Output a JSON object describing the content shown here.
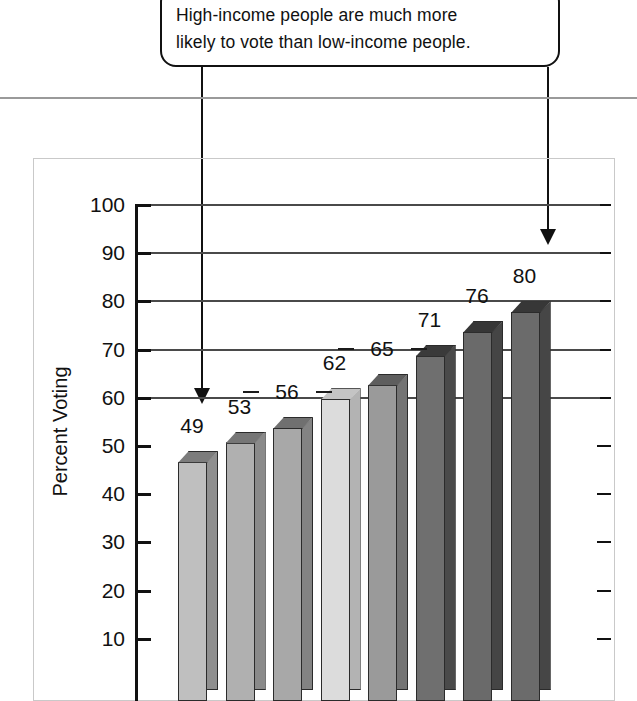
{
  "callout": {
    "text": "High-income people are much more\nlikely to vote than low-income people."
  },
  "chart_data": {
    "type": "bar",
    "title": "",
    "xlabel": "",
    "ylabel": "Percent Voting",
    "ylim": [
      0,
      100
    ],
    "ytick_labels": [
      "100",
      "90",
      "80",
      "70",
      "60",
      "50",
      "40",
      "30",
      "20",
      "10"
    ],
    "ytick_values": [
      100,
      90,
      80,
      70,
      60,
      50,
      40,
      30,
      20,
      10
    ],
    "gridlines_at": [
      100,
      90,
      80,
      70,
      60
    ],
    "grid": true,
    "legend": "none",
    "categories": [
      "1",
      "2",
      "3",
      "4",
      "5",
      "6",
      "7",
      "8"
    ],
    "values": [
      49,
      53,
      56,
      62,
      65,
      71,
      76,
      80
    ],
    "value_labels": [
      "49",
      "53",
      "56",
      "62",
      "65",
      "71",
      "76",
      "80"
    ],
    "bar_colors": [
      "#bfbfbf",
      "#b0b0b0",
      "#a8a8a8",
      "#dcdcdc",
      "#9a9a9a",
      "#6f6f6f",
      "#6a6a6a",
      "#6b6b6b"
    ],
    "bar_side_colors": [
      "#8f8f8f",
      "#8a8a8a",
      "#838383",
      "#b3b3b3",
      "#747474",
      "#4a4a4a",
      "#454545",
      "#464646"
    ],
    "bar_top_colors": [
      "#7c7c7c",
      "#767676",
      "#707070",
      "#c4c4c4",
      "#5e5e5e",
      "#3a3a3a",
      "#363636",
      "#373737"
    ]
  },
  "annotations": {
    "left_pointer": "down-arrow-low-income",
    "right_pointer": "down-arrow-high-income"
  },
  "colors": {
    "rule": "#9a9a9a",
    "frame": "#c9c9c9",
    "ink": "#111111"
  }
}
